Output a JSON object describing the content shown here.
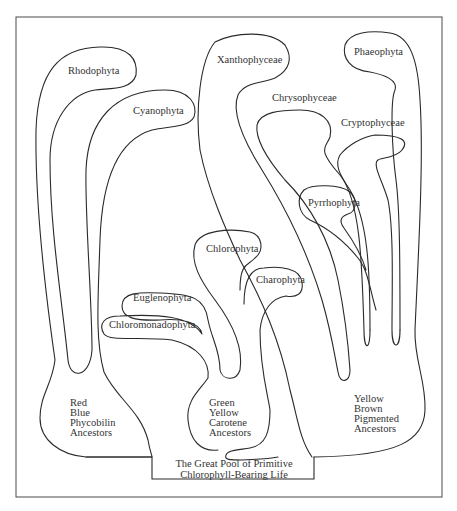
{
  "diagram": {
    "type": "phylogenetic-tree",
    "title": "The Great Pool of Primitive Chlorophyll-Bearing Life",
    "root": {
      "line1": "The Great Pool of Primitive",
      "line2": "Chlorophyll-Bearing Life"
    },
    "ancestor_groups": [
      {
        "id": "red-blue",
        "lines": [
          "Red",
          "Blue",
          "Phycobilin",
          "Ancestors"
        ],
        "descendants": [
          "Rhodophyta",
          "Cyanophyta"
        ]
      },
      {
        "id": "green-yellow",
        "lines": [
          "Green",
          "Yellow",
          "Carotene",
          "Ancestors"
        ],
        "descendants": [
          "Chlorophyta",
          "Charophyta",
          "Euglenophyta",
          "Chloromonadophyta"
        ]
      },
      {
        "id": "yellow-brown",
        "lines": [
          "Yellow",
          "Brown",
          "Pigmented",
          "Ancestors"
        ],
        "descendants": [
          "Xanthophyceae",
          "Chrysophyceae",
          "Phaeophyta",
          "Cryptophyceae",
          "Pyrrhophyta"
        ]
      }
    ],
    "taxa": {
      "rhodophyta": "Rhodophyta",
      "cyanophyta": "Cyanophyta",
      "xanthophyceae": "Xanthophyceae",
      "chrysophyceae": "Chrysophyceae",
      "phaeophyta": "Phaeophyta",
      "cryptophyceae": "Cryptophyceae",
      "pyrrhophyta": "Pyrrhophyta",
      "chlorophyta": "Chlorophyta",
      "charophyta": "Charophyta",
      "euglenophyta": "Euglenophyta",
      "chloromonadophyta": "Chloromonadophyta"
    },
    "colors": {
      "line": "#2a2a2a",
      "text": "#333333",
      "background": "#ffffff"
    }
  }
}
